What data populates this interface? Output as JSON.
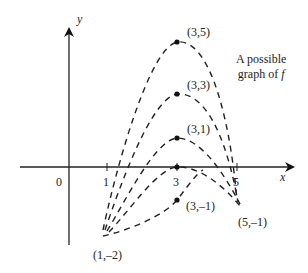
{
  "diagram": {
    "axes": {
      "x_label": "x",
      "y_label": "y",
      "origin_label": "0",
      "x_ticks": [
        "1",
        "3",
        "5"
      ]
    },
    "caption_line1": "A possible",
    "caption_line2": "graph of ",
    "caption_func": "f",
    "points": [
      {
        "label": "(3,5)"
      },
      {
        "label": "(3,3)"
      },
      {
        "label": "(3,1)"
      },
      {
        "label": "(3,–1)"
      },
      {
        "label": "(1,–2)"
      },
      {
        "label": "(5,–1)"
      }
    ],
    "curves": [
      {
        "name": "curve-peak-5",
        "style": "dashed",
        "start": [
          1,
          -2
        ],
        "peak": [
          3,
          5
        ],
        "end": [
          5,
          -1
        ]
      },
      {
        "name": "curve-peak-3",
        "style": "dashed",
        "start": [
          1,
          -2
        ],
        "peak": [
          3,
          3
        ],
        "end": [
          5,
          -1
        ]
      },
      {
        "name": "curve-peak-1",
        "style": "dashed",
        "start": [
          1,
          -2
        ],
        "peak": [
          3,
          1
        ],
        "end": [
          5,
          -1
        ]
      },
      {
        "name": "curve-peak-0",
        "style": "dashed",
        "start": [
          1,
          -2
        ],
        "peak": [
          3,
          0
        ],
        "end": [
          5,
          -1
        ]
      },
      {
        "name": "curve-peak-neg1",
        "style": "dashed",
        "start": [
          1,
          -2
        ],
        "peak": [
          3,
          -1
        ],
        "end": [
          5,
          -1
        ]
      }
    ],
    "line_color": "#222222"
  }
}
